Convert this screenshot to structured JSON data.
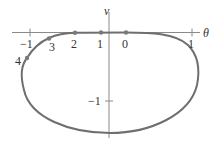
{
  "figure": {
    "x_axis_label": "θ",
    "y_axis_label": "v",
    "x_ticks": [
      {
        "value": -1,
        "label": "−1"
      },
      {
        "value": 1,
        "label": "1"
      }
    ],
    "y_ticks": [
      {
        "value": -1,
        "label": "−1"
      }
    ],
    "points": [
      {
        "label": "0",
        "theta": 0.2,
        "v": 0.0
      },
      {
        "label": "1",
        "theta": -0.1,
        "v": 0.0
      },
      {
        "label": "2",
        "theta": -0.43,
        "v": -0.01
      },
      {
        "label": "3",
        "theta": -0.76,
        "v": -0.1
      },
      {
        "label": "4",
        "theta": -1.02,
        "v": -0.37
      }
    ],
    "curve_description": "Closed phase-plane trajectory: flat along θ-axis near top, bulging down to v≈−1.47 at bottom, θ range ≈ −1.1 to 1.09",
    "colors": {
      "curve": "#6f6f6f",
      "axes": "#8a8a8a",
      "text": "#333333"
    }
  }
}
